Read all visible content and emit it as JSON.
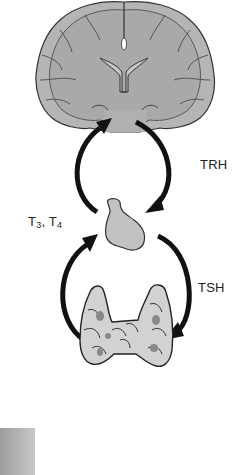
{
  "figure": {
    "type": "hypothalamic-pituitary-thyroid axis",
    "labels": {
      "trh": "TRH",
      "tsh": "TSH",
      "t3": "T",
      "t3_sub": "3",
      "sep": ", ",
      "t4": "T",
      "t4_sub": "4"
    },
    "structures": [
      "brain (coronal section, hypothalamus)",
      "pituitary gland",
      "thyroid gland"
    ],
    "colors": {
      "tissue_fill": "#b8b8b8",
      "outline": "#333333",
      "arrow": "#111111",
      "background": "#ffffff"
    }
  }
}
